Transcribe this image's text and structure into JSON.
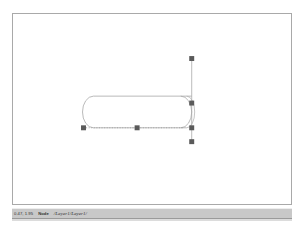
{
  "window": {
    "background_color": "#ffffff"
  },
  "canvas": {
    "name": "drawing-canvas",
    "background_color": "#ffffff",
    "border_color": "#a9a9a9",
    "x": 12,
    "y": 13,
    "width": 280,
    "height": 192
  },
  "shape": {
    "type": "cylinder",
    "stroke_color": "#a0a0a0",
    "fill": "none",
    "label": "Cylinder",
    "left": 82,
    "top": 83,
    "width": 103,
    "height": 32
  },
  "guide": {
    "name": "vertical-guide-line",
    "color": "#9e9e9e",
    "x": 192,
    "y_top": 57,
    "y_bottom": 143
  },
  "selection": {
    "handle_color": "#5a5a5a",
    "handle_size": 4,
    "dotted_line_color": "#8c8c8c",
    "handles": [
      {
        "name": "handle-top",
        "x": 192,
        "y": 58
      },
      {
        "name": "handle-middle-upper",
        "x": 192,
        "y": 101
      },
      {
        "name": "handle-middle-lower",
        "x": 192,
        "y": 113
      },
      {
        "name": "handle-bottom",
        "x": 192,
        "y": 142
      },
      {
        "name": "handle-baseline-left",
        "x": 83,
        "y": 113
      },
      {
        "name": "handle-baseline-center",
        "x": 136,
        "y": 113
      }
    ]
  },
  "status_bar": {
    "background_color": "#c8c8c8",
    "coordinates": "0.47, 1.95",
    "mode": "Node",
    "layer_path": "/Layer1/Layer1/"
  }
}
